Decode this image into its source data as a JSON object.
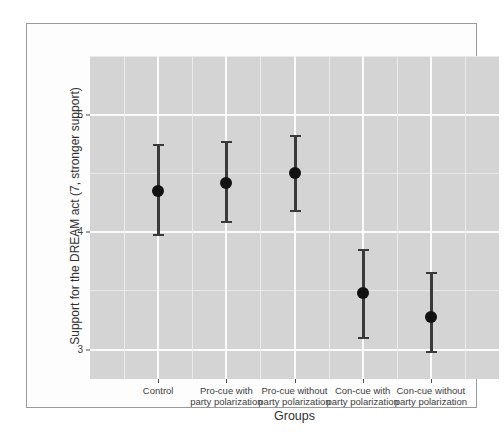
{
  "chart_data": {
    "type": "scatter",
    "title": "",
    "subtitle": "",
    "xlabel": "Groups",
    "ylabel": "Support for the DREAM act (7, stronger support)",
    "categories": [
      "Control",
      "Pro-cue with party polarization",
      "Pro-cue without party polarization",
      "Con-cue with party polarization",
      "Con-cue without party polarization"
    ],
    "values": [
      4.35,
      4.42,
      4.5,
      3.48,
      3.28
    ],
    "error_low": [
      3.97,
      4.08,
      4.17,
      3.09,
      2.97
    ],
    "error_high": [
      4.75,
      4.78,
      4.83,
      3.86,
      3.66
    ],
    "ylim": [
      2.75,
      5.5
    ],
    "y_ticks": [
      3,
      4,
      5
    ],
    "y_tick_labels": [
      "3",
      "4",
      "5"
    ],
    "y_minor_ticks": [
      2.5,
      3.5,
      4.5,
      5.5
    ],
    "grid": true,
    "legend": "none"
  },
  "axes": {
    "x_tick_labels": [
      {
        "line1": "Control",
        "line2": ""
      },
      {
        "line1": "Pro-cue with",
        "line2": "party polarization"
      },
      {
        "line1": "Pro-cue without",
        "line2": "party polarization"
      },
      {
        "line1": "Con-cue with",
        "line2": "party polarization"
      },
      {
        "line1": "Con-cue without",
        "line2": "party polarization"
      }
    ],
    "y_tick_labels": [
      "5",
      "4",
      "3"
    ],
    "x_title": "Groups",
    "y_title": "Support for the DREAM act (7, stronger support)"
  },
  "colors": {
    "panel_background": "#d4d4d4",
    "major_gridline": "#fbfbfb",
    "minor_gridline": "#e9e9e9",
    "point": "#121212",
    "errorbar": "#3a3a3a",
    "frame": "#9a9a9a",
    "text": "#3d3d3d"
  }
}
